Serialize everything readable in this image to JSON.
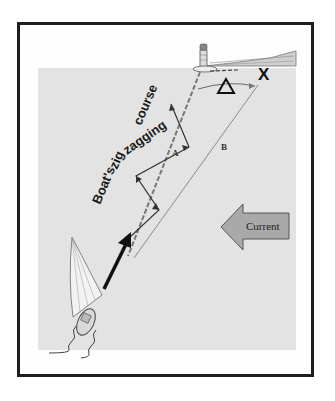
{
  "figure": {
    "caption_text": "Boat's zig zagging course",
    "labels": {
      "current": "Current",
      "line_a": "A",
      "line_b": "B",
      "destination": "X",
      "offset": "Δ"
    },
    "course_words": [
      "Boat's",
      "zig",
      "zagging",
      "course"
    ],
    "colors": {
      "frame": "#1e1e1e",
      "sea": "#e3e3e3",
      "current_arrow_fill": "#a9a9a9",
      "bold_arrow": "#111111",
      "thin_lines": "#6d6d6d"
    },
    "elements": [
      "lighthouse",
      "shoreline",
      "destination-mark-x",
      "offset-triangle",
      "dashed-course-line-a",
      "straight-line-b",
      "zigzag-course",
      "current-arrow",
      "sailboat",
      "heading-arrow",
      "wake-lines"
    ]
  }
}
